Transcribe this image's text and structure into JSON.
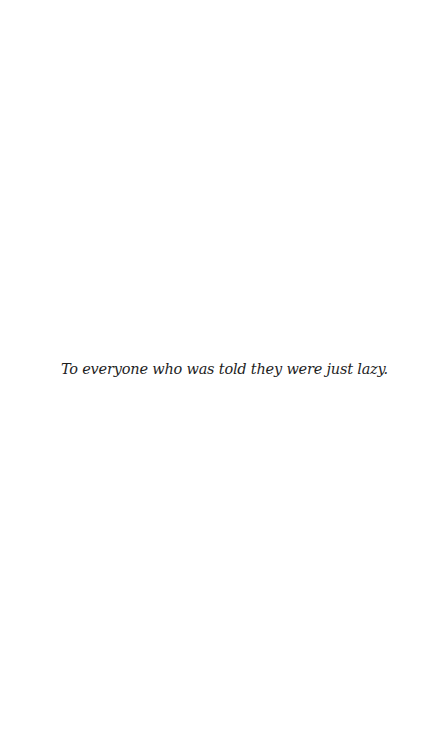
{
  "page": {
    "type": "dedication",
    "dedication_text": "To everyone who was told they were just lazy."
  },
  "colors": {
    "background": "#ffffff",
    "text": "#1e1e1e"
  }
}
